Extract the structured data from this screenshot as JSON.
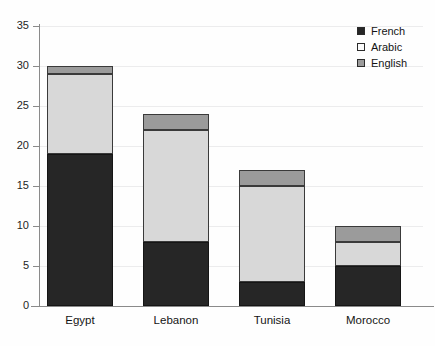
{
  "scan_artifact": {
    "visible_fragment": ""
  },
  "legend": {
    "position": "top-right",
    "entries": [
      {
        "label": "French",
        "color": "#262626",
        "swatch": "filled-black-square-icon"
      },
      {
        "label": "Arabic",
        "color": "#fbfbfb",
        "swatch": "outlined-white-square-icon"
      },
      {
        "label": "English",
        "color": "#9b9b9b",
        "swatch": "filled-gray-square-icon"
      }
    ]
  },
  "axes": {
    "y_ticks": [
      "0",
      "5",
      "10",
      "15",
      "20",
      "25",
      "30",
      "35"
    ],
    "x_ticks": [
      "Egypt",
      "Lebanon",
      "Tunisia",
      "Morocco"
    ]
  },
  "chart_data": {
    "type": "bar",
    "subtype": "stacked-vertical",
    "title": "",
    "subtitle": "",
    "xlabel": "",
    "ylabel": "",
    "categories": [
      "Egypt",
      "Lebanon",
      "Tunisia",
      "Morocco"
    ],
    "series": [
      {
        "name": "French",
        "color": "#262626",
        "values": [
          19,
          8,
          3,
          5
        ]
      },
      {
        "name": "Arabic",
        "color": "#d8d8d8",
        "values": [
          10,
          14,
          12,
          3
        ]
      },
      {
        "name": "English",
        "color": "#9b9b9b",
        "values": [
          1,
          2,
          2,
          2
        ]
      }
    ],
    "stack_order_bottom_to_top": [
      "French",
      "Arabic",
      "English"
    ],
    "totals": [
      30,
      24,
      17,
      10
    ],
    "ylim": [
      0,
      35
    ],
    "ytick_step": 5,
    "grid": "horizontal-faint",
    "legend_position": "top-right"
  }
}
